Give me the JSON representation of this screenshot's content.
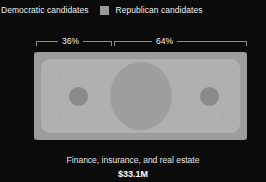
{
  "legend": {
    "items": [
      {
        "label": "Democratic candidates",
        "color": "#2b2b2b",
        "swatch_icon": "legend-swatch-icon"
      },
      {
        "label": "Republican candidates",
        "color": "#9a9a9a",
        "swatch_icon": "legend-swatch-icon"
      }
    ]
  },
  "brackets": {
    "left_pct": "36%",
    "right_pct": "64%"
  },
  "bill": {
    "corner_tl": "1",
    "corner_tr": "1",
    "corner_bl": "1",
    "corner_br": "1"
  },
  "caption": {
    "title": "Finance, insurance, and real estate",
    "amount": "$33.1M"
  },
  "colors": {
    "background": "#0b0b0b",
    "text": "#efefef",
    "bracket_line": "#8d8d8d",
    "bill_outer": "#9d9d9d",
    "bill_inner": "#b0b0b0",
    "bill_portrait": "#9e9e9e",
    "bill_seal": "#8b8b8b",
    "republican_swatch": "#9a9a9a",
    "democratic_swatch": "#2b2b2b"
  },
  "chart_data": {
    "type": "bar",
    "title": "Finance, insurance, and real estate",
    "subtitle": "$33.1M",
    "categories": [
      "Democratic candidates",
      "Republican candidates"
    ],
    "values": [
      36,
      64
    ],
    "value_labels": [
      "36%",
      "64%"
    ],
    "unit": "percent",
    "total_label": "$33.1M",
    "total_value": 33.1,
    "total_unit": "millions of USD",
    "xlabel": "",
    "ylabel": "",
    "xlim": [
      0,
      100
    ],
    "grid": false,
    "legend_position": "top-left",
    "orientation": "horizontal-stacked",
    "annotations": [
      "36%",
      "64%"
    ]
  }
}
